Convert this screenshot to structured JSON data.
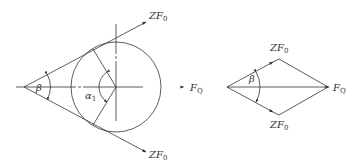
{
  "colors": {
    "line": "#333333",
    "background": "#ffffff"
  },
  "left_diagram": {
    "labels": {
      "force_top": {
        "main": "ZF",
        "sub": "0"
      },
      "force_bottom": {
        "main": "ZF",
        "sub": "0"
      },
      "force_right": {
        "main": "F",
        "sub": "Q"
      },
      "wrap_angle": {
        "main": "α",
        "sub": "1"
      },
      "cone_angle": {
        "main": "β",
        "sub": ""
      }
    }
  },
  "right_diagram": {
    "labels": {
      "force_top": {
        "main": "ZF",
        "sub": "0"
      },
      "force_bottom": {
        "main": "ZF",
        "sub": "0"
      },
      "resultant": {
        "main": "F",
        "sub": "Q"
      },
      "angle": {
        "main": "β",
        "sub": ""
      }
    }
  }
}
